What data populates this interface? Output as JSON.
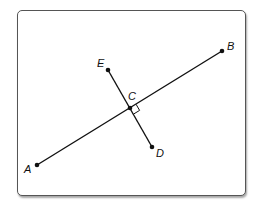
{
  "diagram": {
    "points": [
      {
        "id": "A",
        "label": "A",
        "x": 37,
        "y": 165
      },
      {
        "id": "B",
        "label": "B",
        "x": 222,
        "y": 51
      },
      {
        "id": "C",
        "label": "C",
        "x": 130,
        "y": 108
      },
      {
        "id": "D",
        "label": "D",
        "x": 152,
        "y": 147
      },
      {
        "id": "E",
        "label": "E",
        "x": 108,
        "y": 70
      }
    ],
    "segments": [
      {
        "from": "A",
        "to": "B"
      },
      {
        "from": "E",
        "to": "D"
      }
    ],
    "annotations": [
      {
        "type": "right-angle",
        "at": "C",
        "between": [
          "CB",
          "CD"
        ]
      }
    ],
    "labels": {
      "A": "A",
      "B": "B",
      "C": "C",
      "D": "D",
      "E": "E"
    },
    "colors": {
      "line": "#111111",
      "frame": "#555555"
    }
  }
}
